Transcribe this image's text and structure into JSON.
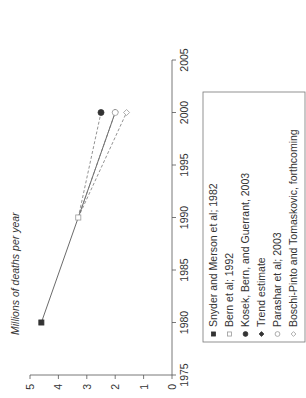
{
  "chart_data": {
    "type": "line",
    "title": "",
    "xlabel": "",
    "ylabel": "Millions of deaths per year",
    "xlim": [
      1975,
      2005
    ],
    "ylim": [
      0,
      5
    ],
    "x_ticks": [
      "1975",
      "1980",
      "1985",
      "1990",
      "1995",
      "2000",
      "2005"
    ],
    "y_ticks": [
      "0",
      "1",
      "2",
      "3",
      "4",
      "5"
    ],
    "orientation": "rotated 90 degrees counter-clockwise",
    "grid": false,
    "legend_position": "right (below plot in rotated view)",
    "series": [
      {
        "name": "Snyder and Merson et al; 1982",
        "marker": "filled-square",
        "x": [
          1980
        ],
        "values": [
          4.6
        ]
      },
      {
        "name": "Bern et al; 1992",
        "marker": "open-square",
        "x": [
          1990
        ],
        "values": [
          3.3
        ]
      },
      {
        "name": "Kosek, Bern, and Guerrant, 2003",
        "marker": "filled-circle",
        "x": [
          2000
        ],
        "values": [
          2.5
        ]
      },
      {
        "name": "Trend estimate",
        "marker": "filled-diamond",
        "x": [
          1980,
          1990,
          2000
        ],
        "values": [
          4.6,
          3.3,
          2.0
        ],
        "line": "solid"
      },
      {
        "name": "Parashar et al; 2003",
        "marker": "open-circle",
        "x": [
          2000
        ],
        "values": [
          2.0
        ]
      },
      {
        "name": "Boschi-Pinto and Tomaskovic, forthcoming",
        "marker": "open-diamond",
        "x": [
          2000
        ],
        "values": [
          1.6
        ]
      }
    ],
    "connectors": [
      {
        "from": [
          1980,
          4.6
        ],
        "to": [
          1990,
          3.3
        ],
        "style": "solid"
      },
      {
        "from": [
          1990,
          3.3
        ],
        "to": [
          2000,
          2.0
        ],
        "style": "solid"
      },
      {
        "from": [
          1990,
          3.3
        ],
        "to": [
          2000,
          2.5
        ],
        "style": "dashed"
      },
      {
        "from": [
          1990,
          3.3
        ],
        "to": [
          2000,
          2.0
        ],
        "style": "dashed"
      },
      {
        "from": [
          1990,
          3.3
        ],
        "to": [
          2000,
          1.6
        ],
        "style": "dashed"
      }
    ]
  },
  "legend": {
    "items": [
      {
        "label": "Snyder and Merson et al; 1982",
        "marker": "filled-square"
      },
      {
        "label": "Bern et al; 1992",
        "marker": "open-square"
      },
      {
        "label": "Kosek, Bern, and Guerrant, 2003",
        "marker": "filled-circle"
      },
      {
        "label": "Trend estimate",
        "marker": "filled-diamond"
      },
      {
        "label": "Parashar et al; 2003",
        "marker": "open-circle"
      },
      {
        "label": "Boschi-Pinto and Tomaskovic, forthcoming",
        "marker": "open-diamond"
      }
    ]
  },
  "colors": {
    "axis": "#555555",
    "line": "#444444",
    "dashed": "#777777",
    "marker_fill": "#333333",
    "open_marker": "#999999"
  }
}
